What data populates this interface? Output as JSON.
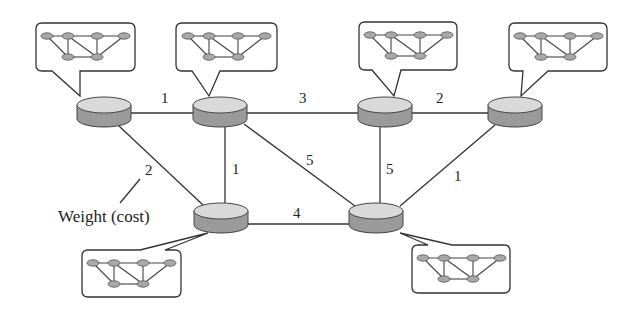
{
  "diagram": {
    "type": "weighted-network-graph",
    "annotation": "Weight (cost)",
    "colors": {
      "router_top": "#d9d9d9",
      "router_side": "#9a9a9a",
      "line": "#333333"
    },
    "routers": [
      {
        "id": "R1",
        "x": 104,
        "y": 104
      },
      {
        "id": "R2",
        "x": 220,
        "y": 104
      },
      {
        "id": "R3",
        "x": 385,
        "y": 104
      },
      {
        "id": "R4",
        "x": 515,
        "y": 104
      },
      {
        "id": "R5",
        "x": 221,
        "y": 210
      },
      {
        "id": "R6",
        "x": 376,
        "y": 210
      }
    ],
    "edges": [
      {
        "from": "R1",
        "to": "R2",
        "weight": "1"
      },
      {
        "from": "R2",
        "to": "R3",
        "weight": "3"
      },
      {
        "from": "R3",
        "to": "R4",
        "weight": "2"
      },
      {
        "from": "R1",
        "to": "R5",
        "weight": "2"
      },
      {
        "from": "R2",
        "to": "R5",
        "weight": "1"
      },
      {
        "from": "R2",
        "to": "R6",
        "weight": "5"
      },
      {
        "from": "R3",
        "to": "R6",
        "weight": "5"
      },
      {
        "from": "R4",
        "to": "R6",
        "weight": "1"
      },
      {
        "from": "R5",
        "to": "R6",
        "weight": "4"
      }
    ],
    "labels": {
      "e_r1_r2": "1",
      "e_r2_r3": "3",
      "e_r3_r4": "2",
      "e_r1_r5": "2",
      "e_r2_r5": "1",
      "e_r2_r6": "5",
      "e_r3_r6": "5",
      "e_r4_r6": "1",
      "e_r5_r6": "4"
    },
    "subnetworks": [
      {
        "attached_to": "R1"
      },
      {
        "attached_to": "R2"
      },
      {
        "attached_to": "R3"
      },
      {
        "attached_to": "R4"
      },
      {
        "attached_to": "R5"
      },
      {
        "attached_to": "R6"
      }
    ]
  }
}
